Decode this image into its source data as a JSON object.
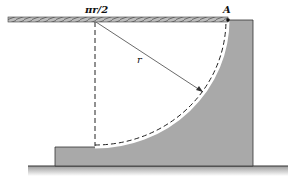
{
  "diagram": {
    "type": "mechanics-figure",
    "labels": {
      "arc_length": "πr/2",
      "radius": "r",
      "point": "A"
    },
    "colors": {
      "fill": "#a9a9a9",
      "stroke": "#333333",
      "background": "#ffffff",
      "ground_shadow": "#cfcfcf"
    }
  }
}
